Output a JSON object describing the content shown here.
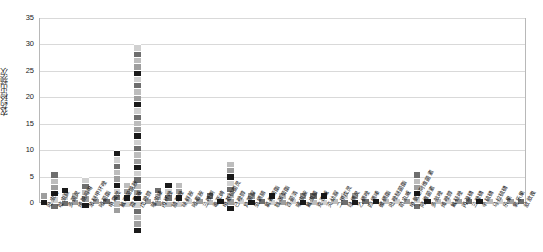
{
  "chart_data": {
    "type": "bar",
    "title": "",
    "xlabel": "",
    "ylabel": "农药检出频次",
    "ylim": [
      0,
      35
    ],
    "yticks": [
      0,
      5,
      10,
      15,
      20,
      25,
      30,
      35
    ],
    "grid": true,
    "legend": null,
    "stacked": true,
    "categories": [
      "吡虫啉",
      "啶虫脒",
      "多菌灵",
      "烯酰吗啉",
      "苯醚甲环唑",
      "嘧菌酯",
      "甲霜灵",
      "氟吡菌酰胺",
      "霜霉威",
      "戊唑醇",
      "噻虫嗪",
      "丙环唑",
      "腈菌唑",
      "咪鲜胺",
      "嘧霉胺",
      "三唑酮",
      "毒死蜱",
      "甲基硫菌灵",
      "己唑醇",
      "异菌脲",
      "虫螨腈",
      "氯氰菊酯",
      "联苯菊酯",
      "百菌清",
      "噻虫胺",
      "氟虫腈",
      "克百威",
      "灭幼脲",
      "二甲戊灵",
      "哒螨灵",
      "乙螨唑",
      "四螨嗪",
      "螺螨酯",
      "吡唑醚菌酯",
      "茚虫威",
      "甲氨基阿维菌素",
      "阿维菌素",
      "多效唑",
      "烯唑醇",
      "氟硅唑",
      "丙溴磷",
      "三唑磷",
      "辛硫磷",
      "马拉硫磷",
      "乐果",
      "氧乐果",
      "敌敌畏"
    ],
    "values": [
      2,
      6,
      3,
      2,
      5,
      1,
      1,
      10,
      4,
      30,
      1,
      3,
      4,
      4,
      1,
      1,
      2,
      1,
      8,
      1,
      2,
      1,
      2,
      2,
      1,
      2,
      2,
      2,
      1,
      2,
      2,
      1,
      1,
      1,
      1,
      1,
      6,
      1,
      1,
      1,
      1,
      1,
      1,
      1,
      1,
      1,
      1
    ],
    "bar_colors": [
      "#9e9e9e",
      "#1a1a1a",
      "#d0d0d0",
      "#6e6e6e",
      "#bdbdbd"
    ]
  }
}
